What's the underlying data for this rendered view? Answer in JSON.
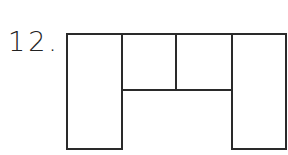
{
  "problem": {
    "number_label": "12."
  },
  "figure": {
    "stroke_color": "#2a2a2a",
    "stroke_width": 2,
    "shapes": [
      {
        "name": "left-tall-rectangle",
        "x": 67,
        "y": 34,
        "w": 55,
        "h": 115
      },
      {
        "name": "top-middle-left-square",
        "x": 122,
        "y": 34,
        "w": 54,
        "h": 56
      },
      {
        "name": "top-middle-right-square",
        "x": 176,
        "y": 34,
        "w": 56,
        "h": 56
      },
      {
        "name": "right-tall-rectangle",
        "x": 232,
        "y": 34,
        "w": 54,
        "h": 115
      }
    ]
  }
}
